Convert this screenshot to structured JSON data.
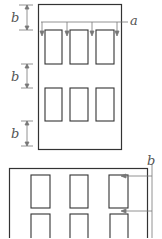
{
  "diagram": {
    "type": "building-facade-dimension-diagram",
    "colors": {
      "stroke": "#333333",
      "dimension": "#777777",
      "label": "#555555"
    },
    "top_facade": {
      "frame": {
        "x": 38,
        "y": 4,
        "w": 83,
        "h": 142
      },
      "window_rows": 2,
      "window_cols": 3,
      "labels": {
        "spacing_a": "a",
        "spacing_b": [
          "b",
          "b",
          "b"
        ]
      }
    },
    "bottom_facade": {
      "frame": {
        "x": 9,
        "y": 168,
        "w": 139,
        "h": 72
      },
      "window_rows": 2,
      "window_cols": 3,
      "labels": {
        "spacing_b": "b"
      }
    }
  }
}
